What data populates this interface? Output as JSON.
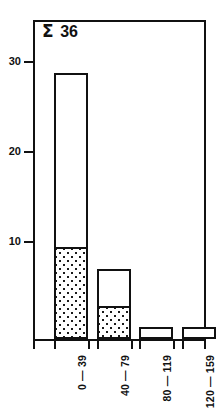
{
  "chart_data": {
    "type": "bar",
    "title": "",
    "subtitle": "",
    "xlabel": "",
    "ylabel": "",
    "categories": [
      "0 — 39",
      "40 — 79",
      "80 — 119",
      "120 — 159"
    ],
    "series": [
      {
        "name": "shaded",
        "values": [
          9,
          3,
          0,
          0
        ]
      },
      {
        "name": "unshaded",
        "values": [
          18,
          4,
          1,
          1
        ]
      }
    ],
    "totals": [
      27,
      7,
      1,
      1
    ],
    "stacked": true,
    "ylim": [
      0,
      32.4
    ],
    "yticks": [
      10,
      20,
      30
    ],
    "ytick_labels": [
      "10",
      "20",
      "30"
    ],
    "grid": false,
    "legend": "none",
    "annotations": [
      {
        "name": "sum-annotation",
        "symbol": "Σ",
        "value": "36"
      }
    ],
    "colors": {
      "outline": "#111111",
      "bar_fill_unshaded": "#ffffff",
      "bar_fill_shaded": "#1a1a1a",
      "background": "#ffffff"
    }
  },
  "axes": {
    "y_ticks": [
      {
        "label": "30",
        "value": 30
      },
      {
        "label": "20",
        "value": 20
      },
      {
        "label": "10",
        "value": 10
      }
    ],
    "x_ticks": [
      {
        "label": "0 — 39"
      },
      {
        "label": "40 — 79"
      },
      {
        "label": "80 — 119"
      },
      {
        "label": "120 — 159"
      }
    ]
  },
  "annotation": {
    "symbol": "Σ",
    "value": "36"
  }
}
